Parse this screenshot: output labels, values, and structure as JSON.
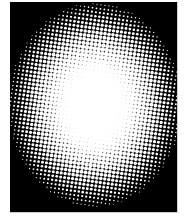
{
  "image": {
    "kind": "halftone-gradient",
    "description": "Elliptical halftone dot gradient: white center fading to black edges",
    "colors": {
      "background": "#000000",
      "dot": "#ffffff",
      "page": "#ffffff"
    },
    "center": {
      "x": 85,
      "y": 103
    },
    "radius": {
      "x": 88,
      "y": 104
    },
    "dot_pitch": 4,
    "rotation_deg": 8
  }
}
